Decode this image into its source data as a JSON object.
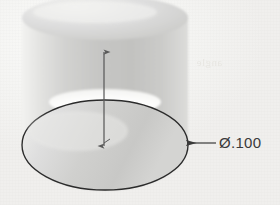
{
  "figure": {
    "type": "engineering-drawing",
    "background_color": "#f4f4f2",
    "line_color": "#2b2b2b"
  },
  "dimension": {
    "symbol": "Ø",
    "symbol_name": "diameter-symbol",
    "value": ".100",
    "full_label": "Ø.100",
    "leader_from": "bottom-ellipse-right-edge",
    "leader_direction": "horizontal-right",
    "arrowhead": "filled-closed"
  },
  "axis": {
    "name": "vertical-center-axis",
    "top_arrowhead": true,
    "bottom_arrowhead": true,
    "color": "#5a5a5a"
  },
  "cylinder": {
    "shading_light": "#ededeb",
    "shading_mid": "#d6d6d4",
    "shading_dark": "#bdbdbb",
    "top_face_highlight": "#fbfbfa",
    "outline_color": "#2b2b2b"
  },
  "ghost_text": {
    "top": "Start Angle 0",
    "middle": "Clockwise",
    "bottom": "Clockwise",
    "right": "angle"
  }
}
